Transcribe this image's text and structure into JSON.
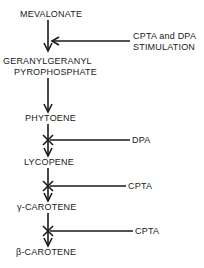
{
  "diagram": {
    "type": "biosynthetic-pathway",
    "nodes": [
      {
        "id": "mevalonate",
        "label": "MEVALONATE"
      },
      {
        "id": "ggpp",
        "label_line1": "GERANYLGERANYL",
        "label_line2": "PYROPHOSPHATE"
      },
      {
        "id": "phytoene",
        "label": "PHYTOENE"
      },
      {
        "id": "lycopene",
        "label": "LYCOPENE"
      },
      {
        "id": "gamma_carotene",
        "label": "γ-CAROTENE"
      },
      {
        "id": "beta_carotene",
        "label": "β-CAROTENE"
      }
    ],
    "effectors": [
      {
        "id": "stimulation",
        "label_line1": "CPTA and DPA",
        "label_line2": "STIMULATION",
        "target": "mevalonate→ggpp",
        "effect": "stimulation"
      },
      {
        "id": "dpa_block",
        "label": "DPA",
        "target": "phytoene→lycopene",
        "effect": "inhibition"
      },
      {
        "id": "cpta_block_1",
        "label": "CPTA",
        "target": "lycopene→gamma_carotene",
        "effect": "inhibition"
      },
      {
        "id": "cpta_block_2",
        "label": "CPTA",
        "target": "gamma_carotene→beta_carotene",
        "effect": "inhibition"
      }
    ]
  }
}
